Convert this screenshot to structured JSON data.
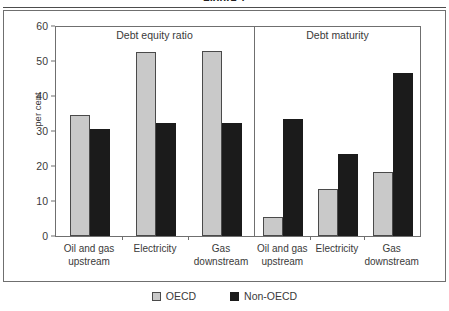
{
  "figure": {
    "caption": "Figure 1",
    "y_axis_label": "per cent",
    "legend": [
      {
        "label": "OECD",
        "color": "#c9c9c9",
        "swatch": "square-outline-icon"
      },
      {
        "label": "Non-OECD",
        "color": "#1b1b1b",
        "swatch": "square-filled-icon"
      }
    ]
  },
  "chart_data": {
    "type": "bar",
    "title": "",
    "xlabel": "",
    "ylabel": "per cent",
    "ylim": [
      0,
      60
    ],
    "yticks": [
      0,
      10,
      20,
      30,
      40,
      50,
      60
    ],
    "grid": false,
    "legend_position": "bottom",
    "panels": [
      {
        "title": "Debt equity ratio",
        "categories": [
          "Oil and gas upstream",
          "Electricity",
          "Gas downstream"
        ],
        "series": [
          {
            "name": "OECD",
            "color": "#c9c9c9",
            "values": [
              34.5,
              52.5,
              53.0
            ]
          },
          {
            "name": "Non-OECD",
            "color": "#1b1b1b",
            "values": [
              30.5,
              32.2,
              32.2
            ]
          }
        ]
      },
      {
        "title": "Debt maturity",
        "categories": [
          "Oil and gas upstream",
          "Electricity",
          "Gas downstream"
        ],
        "series": [
          {
            "name": "OECD",
            "color": "#c9c9c9",
            "values": [
              5.3,
              13.5,
              18.3
            ]
          },
          {
            "name": "Non-OECD",
            "color": "#1b1b1b",
            "values": [
              33.5,
              23.5,
              46.5
            ]
          }
        ]
      }
    ]
  }
}
